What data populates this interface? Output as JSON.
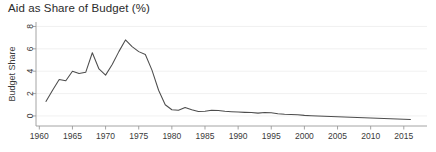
{
  "chart_data": {
    "type": "line",
    "title": "Aid as Share of Budget (%)",
    "xlabel": "",
    "ylabel": "Budget Share",
    "xlim": [
      1959.5,
      2018.5
    ],
    "ylim": [
      -0.9,
      8.4
    ],
    "grid": true,
    "legend": null,
    "legend_position": "none",
    "xticks": [
      1960,
      1965,
      1970,
      1975,
      1980,
      1985,
      1990,
      1995,
      2000,
      2005,
      2010,
      2015
    ],
    "xtick_labels": [
      "1960",
      "1965",
      "1970",
      "1975",
      "1980",
      "1985",
      "1990",
      "1995",
      "2000",
      "2005",
      "2010",
      "2015"
    ],
    "yticks": [
      0,
      2,
      4,
      6,
      8
    ],
    "ytick_labels": [
      "0",
      "2",
      "4",
      "6",
      "8"
    ],
    "line_color": "#4d4d4d",
    "series": [
      {
        "name": "Budget Share",
        "x": [
          1961,
          1962,
          1963,
          1964,
          1965,
          1966,
          1967,
          1968,
          1969,
          1970,
          1971,
          1972,
          1973,
          1974,
          1975,
          1976,
          1977,
          1978,
          1979,
          1980,
          1981,
          1982,
          1983,
          1984,
          1985,
          1986,
          1987,
          1988,
          1989,
          1990,
          1991,
          1992,
          1993,
          1994,
          1995,
          1996,
          1997,
          1998,
          1999,
          2000,
          2001,
          2002,
          2003,
          2004,
          2005,
          2006,
          2007,
          2008,
          2009,
          2010,
          2011,
          2012,
          2013,
          2014,
          2015,
          2016
        ],
        "values": [
          1.3,
          2.3,
          3.25,
          3.15,
          4.0,
          3.8,
          3.9,
          5.65,
          4.2,
          3.65,
          4.6,
          5.75,
          6.8,
          6.2,
          5.75,
          5.5,
          4.1,
          2.3,
          1.0,
          0.55,
          0.5,
          0.75,
          0.55,
          0.4,
          0.42,
          0.5,
          0.48,
          0.42,
          0.38,
          0.35,
          0.32,
          0.3,
          0.25,
          0.3,
          0.28,
          0.2,
          0.15,
          0.12,
          0.1,
          0.05,
          0.02,
          0.0,
          -0.02,
          -0.05,
          -0.08,
          -0.1,
          -0.12,
          -0.14,
          -0.16,
          -0.18,
          -0.2,
          -0.22,
          -0.25,
          -0.27,
          -0.3,
          -0.32
        ]
      }
    ]
  }
}
